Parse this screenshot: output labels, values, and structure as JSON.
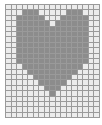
{
  "grid": {
    "cols": 17,
    "rows": 21,
    "filled_color": "#8c8c8c",
    "empty_color": "#ececec",
    "line_color": "#9a9a9a",
    "pattern": [
      "00000000000000000",
      "00011100000111000",
      "00111110001111100",
      "00111111011111100",
      "00111111111111100",
      "00111111111111100",
      "00111111111111100",
      "00111111111111100",
      "00111111111111100",
      "00111111111111100",
      "00111111111111100",
      "00011111111111000",
      "00001111111110000",
      "00000111111100000",
      "00000011111000000",
      "00000001110000000",
      "00000000100000000",
      "00000000000000000",
      "00000000000000000",
      "00000000000000000",
      "00000000000000000"
    ],
    "shape": "heart"
  }
}
